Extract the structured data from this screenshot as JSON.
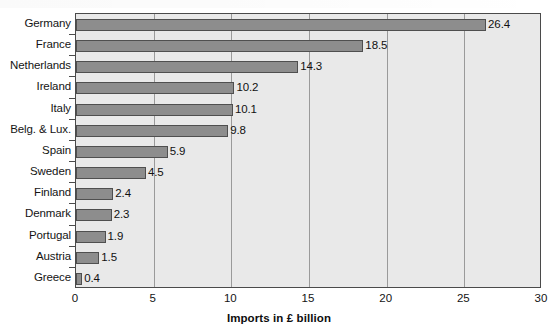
{
  "chart_data": {
    "type": "bar",
    "orientation": "horizontal",
    "title": "",
    "subtitle": "",
    "xlabel": "Imports in £ billion",
    "ylabel": "",
    "xlim": [
      0,
      30
    ],
    "xticks": [
      0,
      5,
      10,
      15,
      20,
      25,
      30
    ],
    "xtick_labels": [
      "0",
      "5",
      "10",
      "15",
      "20",
      "25",
      "30"
    ],
    "grid": true,
    "grid_axis": "x",
    "legend": false,
    "legend_position": "none",
    "categories": [
      "Germany",
      "France",
      "Netherlands",
      "Ireland",
      "Italy",
      "Belg. & Lux.",
      "Spain",
      "Sweden",
      "Finland",
      "Denmark",
      "Portugal",
      "Austria",
      "Greece"
    ],
    "values": [
      26.4,
      18.5,
      14.3,
      10.2,
      10.1,
      9.8,
      5.9,
      4.5,
      2.4,
      2.3,
      1.9,
      1.5,
      0.4
    ],
    "data_labels": [
      "26.4",
      "18.5",
      "14.3",
      "10.2",
      "10.1",
      "9.8",
      "5.9",
      "4.5",
      "2.4",
      "2.3",
      "1.9",
      "1.5",
      "0.4"
    ],
    "units": "£ billion",
    "colors": {
      "bar_fill": "#8d8d8d",
      "bar_border": "#4f4f4f",
      "plot_background": "#e9e9e9",
      "plot_border": "#4a4a4a",
      "gridline": "#9a9a9a",
      "text": "#141414",
      "page_background": "#ffffff"
    }
  }
}
